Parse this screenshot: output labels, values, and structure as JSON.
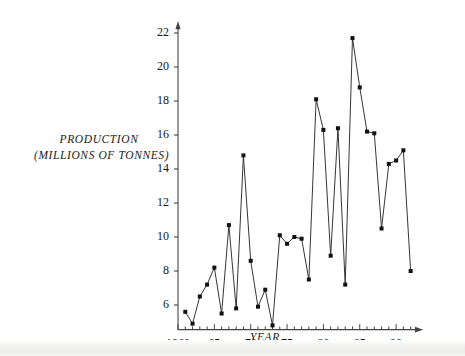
{
  "chart_data": {
    "type": "line",
    "title": "",
    "subtitle": "",
    "xlabel": "YEAR",
    "ylabel_line1": "PRODUCTION",
    "ylabel_line2": "(MILLIONS OF TONNES)",
    "ylabel": "PRODUCTION (MILLIONS OF TONNES)",
    "grid": false,
    "legend": "none",
    "marker": "filled-square",
    "line_color": "#2b2b2b",
    "marker_color": "#111111",
    "axis_color": "#444444",
    "background_color": "#ffffff",
    "xlim": [
      1960,
      1992.5
    ],
    "ylim": [
      4.2,
      22.8
    ],
    "x_major_ticks": [
      1960,
      1965,
      1970,
      1975,
      1980,
      1985,
      1990
    ],
    "x_major_tick_labels": [
      "1960",
      "65",
      "70",
      "75",
      "80",
      "85",
      "90"
    ],
    "x_minor_tick_step": 1,
    "y_ticks": [
      6,
      8,
      10,
      12,
      14,
      16,
      18,
      20,
      22
    ],
    "y_tick_labels": [
      "6",
      "8",
      "10",
      "12",
      "14",
      "16",
      "18",
      "20",
      "22"
    ],
    "x_axis_arrow": true,
    "y_axis_arrow": true,
    "x": [
      1961,
      1962,
      1963,
      1964,
      1965,
      1966,
      1967,
      1968,
      1969,
      1970,
      1971,
      1972,
      1973,
      1974,
      1975,
      1976,
      1977,
      1978,
      1979,
      1980,
      1981,
      1982,
      1983,
      1984,
      1985,
      1986,
      1987,
      1988,
      1989,
      1990,
      1991,
      1992
    ],
    "values": [
      5.6,
      4.9,
      6.5,
      7.2,
      8.2,
      5.5,
      10.7,
      5.8,
      14.8,
      8.6,
      5.9,
      6.9,
      4.8,
      10.1,
      9.6,
      10.0,
      9.9,
      7.5,
      18.1,
      16.3,
      8.9,
      16.4,
      7.2,
      21.7,
      18.8,
      16.2,
      16.1,
      10.5,
      14.3,
      14.5,
      15.1,
      8.0
    ],
    "series": [
      {
        "name": "Production",
        "values": [
          5.6,
          4.9,
          6.5,
          7.2,
          8.2,
          5.5,
          10.7,
          5.8,
          14.8,
          8.6,
          5.9,
          6.9,
          4.8,
          10.1,
          9.6,
          10.0,
          9.9,
          7.5,
          18.1,
          16.3,
          8.9,
          16.4,
          7.2,
          21.7,
          18.8,
          16.2,
          16.1,
          10.5,
          14.3,
          14.5,
          15.1,
          8.0
        ]
      }
    ]
  }
}
